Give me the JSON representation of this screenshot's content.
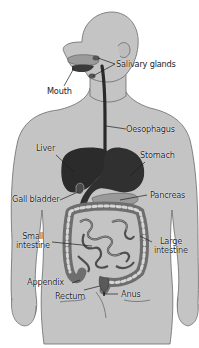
{
  "diagram": {
    "colors": {
      "background": "#ffffff",
      "body_fill": "#c4c4c4",
      "body_outline": "#6a6a6a",
      "organ_dark": "#2a2a2a",
      "intestine_fill": "#8a8a8a",
      "intestine_highlight": "#d8d8d8",
      "label_text": "#1e1e1e",
      "leader_line": "#1e1e1e"
    },
    "labels": {
      "salivary_glands": "Salivary glands",
      "mouth": "Mouth",
      "oesophagus": "Oesophagus",
      "liver": "Liver",
      "stomach": "Stomach",
      "gall_bladder": "Gall bladder",
      "pancreas": "Pancreas",
      "small_intestine_1": "Small",
      "small_intestine_2": "intestine",
      "large_intestine_1": "Large",
      "large_intestine_2": "intestine",
      "appendix": "Appendix",
      "rectum": "Rectum",
      "anus": "Anus"
    }
  }
}
